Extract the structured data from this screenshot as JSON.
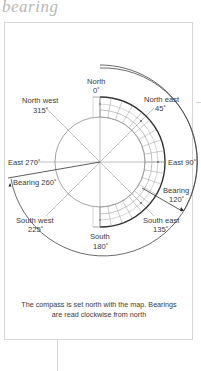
{
  "heading": "bearing",
  "diagram": {
    "labels": {
      "north": "North",
      "north_deg": "0˚",
      "north_east": "North east",
      "north_east_deg": "45˚",
      "east": "East 90˚",
      "south_east": "South east",
      "south_east_deg": "135˚",
      "south": "South",
      "south_deg": "180˚",
      "south_west": "South west",
      "south_west_deg": "225˚",
      "west": "East 270˚",
      "north_west": "North west",
      "north_west_deg": "315˚",
      "bearing_a": "Bearing",
      "bearing_a_deg": "120˚",
      "bearing_b": "Bearing 260˚"
    },
    "bearings_shown": [
      120,
      260
    ],
    "colors": {
      "line": "#9a9a9a",
      "dark_line": "#333333",
      "text": "#3a3a3a"
    }
  },
  "caption": {
    "line1": "The compass is set north with the map. Bearings",
    "line2": "are read clockwise from north"
  }
}
